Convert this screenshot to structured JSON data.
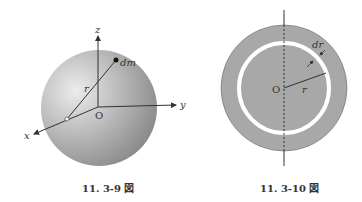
{
  "figures": [
    {
      "caption": "11. 3-9 図",
      "labels": {
        "z": "z",
        "y": "y",
        "x": "x",
        "origin": "O",
        "radius": "r",
        "mass_element": "dm"
      }
    },
    {
      "caption": "11. 3-10 図",
      "labels": {
        "origin": "O",
        "radius": "r",
        "thickness": "dr"
      }
    }
  ],
  "colors": {
    "sphere_light": "#e6e6e6",
    "sphere_dark": "#8a8a8a",
    "disk": "#a8a8a8",
    "ring": "#ffffff",
    "line": "#333333"
  }
}
